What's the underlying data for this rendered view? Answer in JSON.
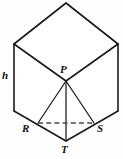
{
  "figure": {
    "type": "geometry-diagram",
    "background_color": "#fefefe",
    "stroke_color": "#1a1a1a",
    "hidden_stroke_color": "#4a4a4a",
    "labels": {
      "height": "h",
      "apex": "P",
      "left_base": "R",
      "right_base": "S",
      "bottom": "T"
    },
    "points": {
      "top_apex": {
        "x": 66,
        "y": 3
      },
      "top_left": {
        "x": 14,
        "y": 44
      },
      "top_right": {
        "x": 118,
        "y": 44
      },
      "center_P": {
        "x": 66,
        "y": 81
      },
      "bottom_left": {
        "x": 14,
        "y": 111
      },
      "bottom_right": {
        "x": 118,
        "y": 111
      },
      "R": {
        "x": 38,
        "y": 123
      },
      "S": {
        "x": 94,
        "y": 123
      },
      "T": {
        "x": 66,
        "y": 141
      }
    },
    "edges": [
      {
        "name": "top-face-upper-left",
        "from": "top_left",
        "to": "top_apex",
        "style": "solid"
      },
      {
        "name": "top-face-upper-right",
        "from": "top_apex",
        "to": "top_right",
        "style": "solid"
      },
      {
        "name": "top-face-lower-left",
        "from": "top_left",
        "to": "center_P",
        "style": "solid"
      },
      {
        "name": "top-face-lower-right",
        "from": "center_P",
        "to": "top_right",
        "style": "solid"
      },
      {
        "name": "left-vertical",
        "from": "top_left",
        "to": "bottom_left",
        "style": "solid"
      },
      {
        "name": "right-vertical",
        "from": "top_right",
        "to": "bottom_right",
        "style": "solid"
      },
      {
        "name": "front-left-lower",
        "from": "bottom_left",
        "to": "T",
        "style": "solid"
      },
      {
        "name": "front-right-lower",
        "from": "bottom_right",
        "to": "T",
        "style": "solid"
      },
      {
        "name": "pyramid-P-R",
        "from": "center_P",
        "to": "R",
        "style": "thin"
      },
      {
        "name": "pyramid-P-S",
        "from": "center_P",
        "to": "S",
        "style": "thin"
      },
      {
        "name": "pyramid-P-T",
        "from": "center_P",
        "to": "T",
        "style": "thin"
      },
      {
        "name": "base-R-S-hidden",
        "from": "R",
        "to": "S",
        "style": "dashed"
      }
    ]
  }
}
